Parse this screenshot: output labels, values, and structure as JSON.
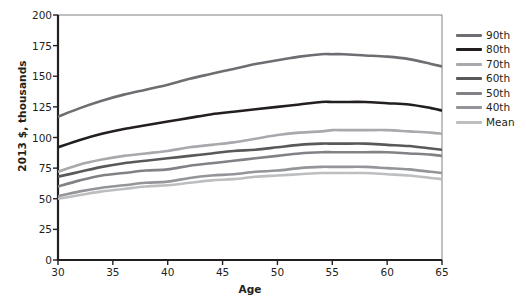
{
  "chart_data": {
    "type": "line",
    "title": "",
    "xlabel": "Age",
    "ylabel": "2013 $, thousands",
    "xlim": [
      30,
      65
    ],
    "ylim": [
      0,
      200
    ],
    "xticks": [
      30,
      35,
      40,
      45,
      50,
      55,
      60,
      65
    ],
    "yticks": [
      0,
      25,
      50,
      75,
      100,
      125,
      150,
      175,
      200
    ],
    "grid": false,
    "legend_position": "right",
    "x": [
      30,
      32,
      34,
      36,
      38,
      40,
      42,
      44,
      46,
      48,
      50,
      52,
      54,
      55,
      56,
      58,
      60,
      62,
      64,
      65
    ],
    "series": [
      {
        "name": "90th",
        "color": "#6d6e71",
        "width": 2.6,
        "values": [
          117,
          124,
          130,
          135,
          139,
          143,
          148,
          152,
          156,
          160,
          163,
          166,
          168,
          168,
          168,
          167,
          166,
          164,
          160,
          158
        ]
      },
      {
        "name": "80th",
        "color": "#231f20",
        "width": 2.6,
        "values": [
          92,
          98,
          103,
          107,
          110,
          113,
          116,
          119,
          121,
          123,
          125,
          127,
          129,
          129,
          129,
          129,
          128,
          127,
          124,
          122
        ]
      },
      {
        "name": "70th",
        "color": "#a7a9ac",
        "width": 2.6,
        "values": [
          72,
          78,
          82,
          85,
          87,
          89,
          92,
          94,
          96,
          99,
          102,
          104,
          105,
          106,
          106,
          106,
          106,
          105,
          104,
          103
        ]
      },
      {
        "name": "60th",
        "color": "#58595b",
        "width": 2.6,
        "values": [
          68,
          72,
          76,
          79,
          81,
          83,
          85,
          87,
          89,
          90,
          92,
          94,
          95,
          95,
          95,
          95,
          94,
          93,
          91,
          90
        ]
      },
      {
        "name": "50th",
        "color": "#808285",
        "width": 2.6,
        "values": [
          60,
          65,
          69,
          71,
          73,
          74,
          77,
          79,
          81,
          83,
          85,
          87,
          88,
          88,
          88,
          88,
          88,
          87,
          86,
          85
        ]
      },
      {
        "name": "40th",
        "color": "#939598",
        "width": 2.6,
        "values": [
          52,
          56,
          59,
          61,
          63,
          64,
          67,
          69,
          70,
          72,
          73,
          75,
          76,
          76,
          76,
          76,
          75,
          74,
          72,
          71
        ]
      },
      {
        "name": "Mean",
        "color": "#bcbec0",
        "width": 2.6,
        "values": [
          50,
          53,
          56,
          58,
          60,
          61,
          63,
          65,
          66,
          68,
          69,
          70,
          71,
          71,
          71,
          71,
          70,
          69,
          67,
          66
        ]
      }
    ]
  },
  "axes": {
    "frame_color": "#808285",
    "axis_color": "#231f20"
  }
}
